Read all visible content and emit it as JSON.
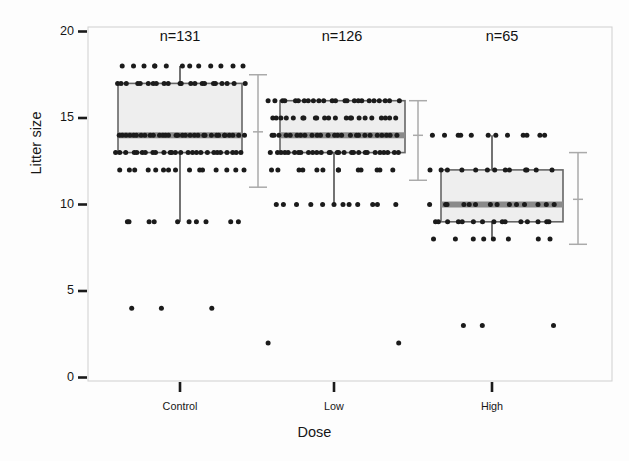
{
  "chart_data": {
    "type": "box",
    "title": "",
    "xlabel": "Dose",
    "ylabel": "Litter size",
    "ylim": [
      0,
      20
    ],
    "yticks": [
      0,
      5,
      10,
      15,
      20
    ],
    "ytick_labels": [
      "0",
      "5",
      "10",
      "15",
      "20"
    ],
    "categories": [
      "Control",
      "Low",
      "High"
    ],
    "grid": false,
    "legend": "none",
    "annotations": [
      "n=131",
      "n=126",
      "n=65"
    ],
    "groups": [
      {
        "name": "Control",
        "n_label": "n=131",
        "n": 131,
        "box": {
          "q1": 13,
          "median": 14,
          "q3": 17,
          "whisker_low": 9,
          "whisker_high": 18
        },
        "ci": {
          "low": 11.0,
          "mean": 14.2,
          "high": 17.5
        },
        "strip_values": [
          18,
          17,
          14,
          13,
          12,
          9,
          4
        ],
        "strip_counts": [
          13,
          22,
          32,
          26,
          15,
          10,
          3
        ]
      },
      {
        "name": "Low",
        "n_label": "n=126",
        "n": 126,
        "box": {
          "q1": 13,
          "median": 14,
          "q3": 16,
          "whisker_low": 10,
          "whisker_high": 16
        },
        "ci": {
          "low": 11.4,
          "mean": 14.0,
          "high": 16.0
        },
        "strip_values": [
          16,
          15,
          14,
          13,
          12,
          10,
          2
        ],
        "strip_counts": [
          24,
          22,
          25,
          28,
          13,
          12,
          2
        ]
      },
      {
        "name": "High",
        "n_label": "n=65",
        "n": 65,
        "box": {
          "q1": 9,
          "median": 10,
          "q3": 12,
          "whisker_low": 8,
          "whisker_high": 14
        },
        "ci": {
          "low": 7.7,
          "mean": 10.3,
          "high": 13.0
        },
        "strip_values": [
          14,
          12,
          10,
          9,
          8,
          3
        ],
        "strip_counts": [
          12,
          13,
          14,
          15,
          8,
          3
        ]
      }
    ],
    "colors": {
      "box_fill": "#eeeeee",
      "box_edge": "#666666",
      "median": "#8a8a8a",
      "point": "#1b1b1b",
      "ci": "#aaaaaa",
      "frame": "#cfcfcf",
      "text": "#161616"
    }
  }
}
